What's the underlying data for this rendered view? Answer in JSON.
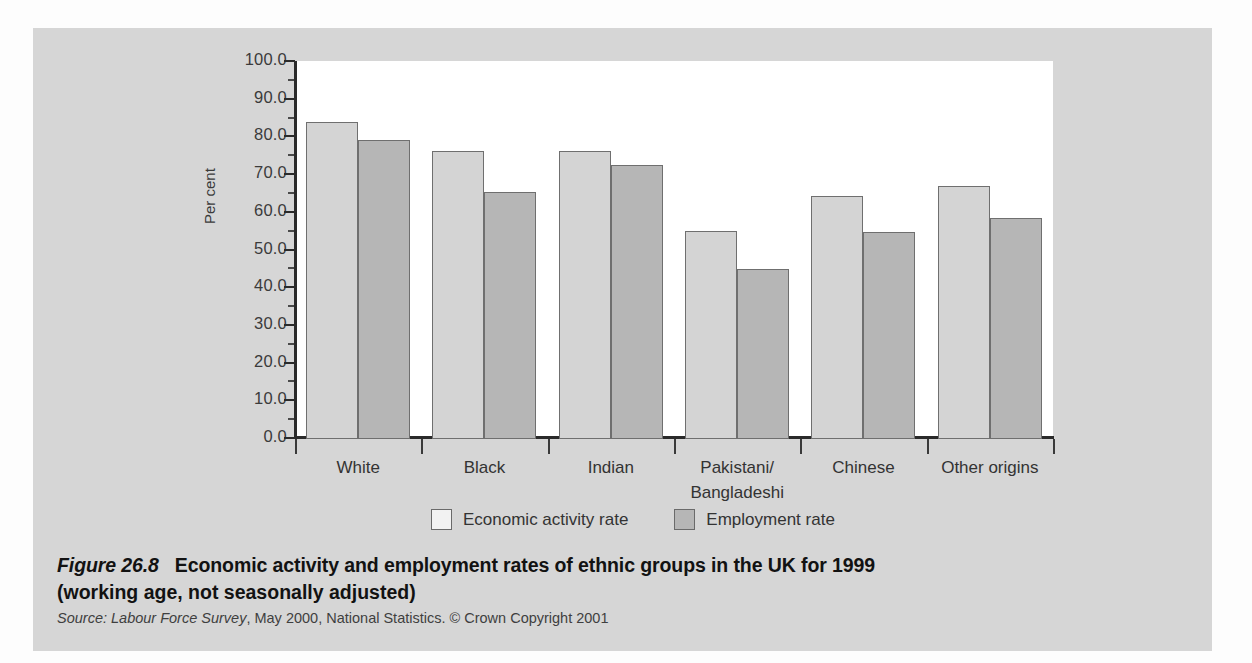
{
  "chart_data": {
    "type": "bar",
    "title": "Economic activity and employment rates of ethnic groups in the UK for 1999 (working age, not seasonally adjusted)",
    "xlabel": "",
    "ylabel": "Per cent",
    "ylim": [
      0.0,
      100.0
    ],
    "ytick_step": 10.0,
    "grid": false,
    "legend_position": "bottom-center",
    "categories": [
      "White",
      "Black",
      "Indian",
      "Pakistani/\nBangladeshi",
      "Chinese",
      "Other origins"
    ],
    "category_labels": [
      {
        "line1": "White",
        "line2": ""
      },
      {
        "line1": "Black",
        "line2": ""
      },
      {
        "line1": "Indian",
        "line2": ""
      },
      {
        "line1": "Pakistani/",
        "line2": "Bangladeshi"
      },
      {
        "line1": "Chinese",
        "line2": ""
      },
      {
        "line1": "Other origins",
        "line2": ""
      }
    ],
    "ytick_labels": [
      "100.0",
      "90.0",
      "80.0",
      "70.0",
      "60.0",
      "50.0",
      "40.0",
      "30.0",
      "20.0",
      "10.0",
      "0.0"
    ],
    "ytick_values": [
      100.0,
      90.0,
      80.0,
      70.0,
      60.0,
      50.0,
      40.0,
      30.0,
      20.0,
      10.0,
      0.0
    ],
    "series": [
      {
        "name": "Economic activity rate",
        "color": "#d4d4d4",
        "values": [
          84.0,
          76.3,
          76.3,
          55.1,
          64.4,
          67.0
        ]
      },
      {
        "name": "Employment rate",
        "color": "#b6b6b6",
        "values": [
          79.3,
          65.4,
          72.6,
          45.2,
          54.8,
          58.5
        ]
      }
    ]
  },
  "legend": {
    "items": [
      {
        "label": "Economic activity rate",
        "swatch": "light"
      },
      {
        "label": "Employment rate",
        "swatch": "dark"
      }
    ]
  },
  "caption": {
    "figure_number": "Figure 26.8",
    "title_line1": "Economic activity and employment rates of ethnic groups in the UK for 1999",
    "title_line2": "(working age, not seasonally adjusted)",
    "source_word": "Source:",
    "source_publication": "Labour Force Survey",
    "source_rest": ", May 2000, National Statistics. © Crown Copyright 2001"
  },
  "colors": {
    "panel_background": "#d6d6d6",
    "plot_background": "#ffffff",
    "series_light": "#d4d4d4",
    "series_dark": "#b6b6b6",
    "axis": "#2a2a2a",
    "text": "#333333"
  }
}
